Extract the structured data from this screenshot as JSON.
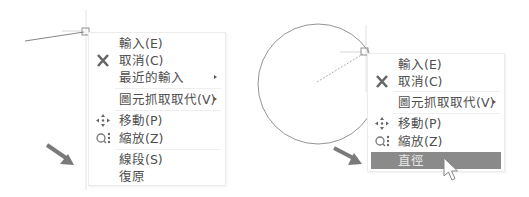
{
  "left_panel": {
    "menu": {
      "items": [
        {
          "label": "輸入(E)",
          "icon": null,
          "submenu": false
        },
        {
          "label": "取消(C)",
          "icon": "cancel-x-icon",
          "submenu": false
        },
        {
          "label": "最近的輸入",
          "icon": null,
          "submenu": true
        },
        {
          "label": "圖元抓取取代(V)",
          "icon": null,
          "submenu": true
        },
        {
          "label": "移動(P)",
          "icon": "move-icon",
          "submenu": false
        },
        {
          "label": "縮放(Z)",
          "icon": "zoom-icon",
          "submenu": false
        },
        {
          "label": "線段(S)",
          "icon": null,
          "submenu": false
        },
        {
          "label": "復原",
          "icon": null,
          "submenu": false
        }
      ]
    },
    "pointer_arrow": "arrow-right-down-icon"
  },
  "right_panel": {
    "menu": {
      "items": [
        {
          "label": "輸入(E)",
          "icon": null,
          "submenu": false
        },
        {
          "label": "取消(C)",
          "icon": "cancel-x-icon",
          "submenu": false
        },
        {
          "label": "圖元抓取取代(V)",
          "icon": null,
          "submenu": true
        },
        {
          "label": "移動(P)",
          "icon": "move-icon",
          "submenu": false
        },
        {
          "label": "縮放(Z)",
          "icon": "zoom-icon",
          "submenu": false
        },
        {
          "label": "直徑",
          "icon": null,
          "submenu": false,
          "highlighted": true
        }
      ]
    },
    "pointer_arrow": "arrow-right-down-icon",
    "cursor": "mouse-pointer-icon"
  },
  "colors": {
    "highlight": "#8a8a8a",
    "arrow": "#7a7a7a",
    "text": "#4e4e4e"
  }
}
